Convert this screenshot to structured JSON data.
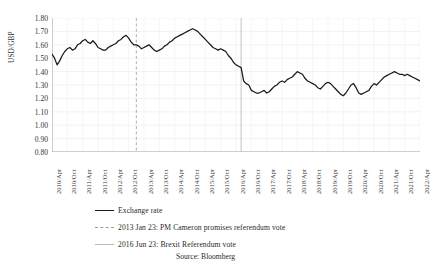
{
  "page": {
    "title_fragment": "",
    "source_note": "Source: Bloomberg"
  },
  "axes": {
    "ylabel": "USD/GBP",
    "yticks": [
      "1.80",
      "1.70",
      "1.60",
      "1.50",
      "1.40",
      "1.30",
      "1.20",
      "1.10",
      "1.00",
      "0.90",
      "0.80"
    ],
    "xticks": [
      "2010/Apr",
      "2010/Oct",
      "2011/Apr",
      "2011/Oct",
      "2012/Apr",
      "2012/Oct",
      "2013/Apr",
      "2013/Oct",
      "2014/Apr",
      "2014/Oct",
      "2015/Apr",
      "2015/Oct",
      "2016/Apr",
      "2016/Oct",
      "2017/Apr",
      "2017/Oct",
      "2018/Apr",
      "2018/Oct",
      "2019/Apr",
      "2019/Oct",
      "2020/Apr",
      "2020/Oct",
      "2021/Apr",
      "2021/Oct",
      "2022/Apr"
    ]
  },
  "legend": {
    "items": [
      {
        "label": "Exchange rate",
        "style": "solid-black"
      },
      {
        "label": "2013 Jan 23: PM Cameron promises referendum vote",
        "style": "dashed-grey"
      },
      {
        "label": "2016 Jun 23: Brexit Referendum vote",
        "style": "solid-grey"
      }
    ]
  },
  "chart_data": {
    "type": "line",
    "title": "",
    "xlabel": "",
    "ylabel": "USD/GBP",
    "ylim": [
      0.8,
      1.8
    ],
    "ytick_step": 0.1,
    "grid": true,
    "legend_position": "below",
    "x_start": "2010-04",
    "x_end": "2022-04",
    "x_tick_interval_months": 6,
    "annotations": [
      {
        "label": "2013 Jan 23: PM Cameron promises referendum vote",
        "x": "2013-01",
        "style": "dashed-grey vertical line"
      },
      {
        "label": "2016 Jun 23: Brexit Referendum vote",
        "x": "2016-06",
        "style": "solid-grey vertical line"
      }
    ],
    "series": [
      {
        "name": "Exchange rate",
        "color": "#1a1a1a",
        "x": [
          "2010-04",
          "2010-05",
          "2010-06",
          "2010-07",
          "2010-08",
          "2010-09",
          "2010-10",
          "2010-11",
          "2010-12",
          "2011-01",
          "2011-02",
          "2011-03",
          "2011-04",
          "2011-05",
          "2011-06",
          "2011-07",
          "2011-08",
          "2011-09",
          "2011-10",
          "2011-11",
          "2011-12",
          "2012-01",
          "2012-02",
          "2012-03",
          "2012-04",
          "2012-05",
          "2012-06",
          "2012-07",
          "2012-08",
          "2012-09",
          "2012-10",
          "2012-11",
          "2012-12",
          "2013-01",
          "2013-02",
          "2013-03",
          "2013-04",
          "2013-05",
          "2013-06",
          "2013-07",
          "2013-08",
          "2013-09",
          "2013-10",
          "2013-11",
          "2013-12",
          "2014-01",
          "2014-02",
          "2014-03",
          "2014-04",
          "2014-05",
          "2014-06",
          "2014-07",
          "2014-08",
          "2014-09",
          "2014-10",
          "2014-11",
          "2014-12",
          "2015-01",
          "2015-02",
          "2015-03",
          "2015-04",
          "2015-05",
          "2015-06",
          "2015-07",
          "2015-08",
          "2015-09",
          "2015-10",
          "2015-11",
          "2015-12",
          "2016-01",
          "2016-02",
          "2016-03",
          "2016-04",
          "2016-05",
          "2016-06",
          "2016-07",
          "2016-08",
          "2016-09",
          "2016-10",
          "2016-11",
          "2016-12",
          "2017-01",
          "2017-02",
          "2017-03",
          "2017-04",
          "2017-05",
          "2017-06",
          "2017-07",
          "2017-08",
          "2017-09",
          "2017-10",
          "2017-11",
          "2017-12",
          "2018-01",
          "2018-02",
          "2018-03",
          "2018-04",
          "2018-05",
          "2018-06",
          "2018-07",
          "2018-08",
          "2018-09",
          "2018-10",
          "2018-11",
          "2018-12",
          "2019-01",
          "2019-02",
          "2019-03",
          "2019-04",
          "2019-05",
          "2019-06",
          "2019-07",
          "2019-08",
          "2019-09",
          "2019-10",
          "2019-11",
          "2019-12",
          "2020-01",
          "2020-02",
          "2020-03",
          "2020-04",
          "2020-05",
          "2020-06",
          "2020-07",
          "2020-08",
          "2020-09",
          "2020-10",
          "2020-11",
          "2020-12",
          "2021-01",
          "2021-02",
          "2021-03",
          "2021-04",
          "2021-05",
          "2021-06",
          "2021-07",
          "2021-08",
          "2021-09",
          "2021-10",
          "2021-11",
          "2021-12",
          "2022-01",
          "2022-02",
          "2022-03",
          "2022-04"
        ],
        "values": [
          1.53,
          1.5,
          1.45,
          1.48,
          1.52,
          1.55,
          1.57,
          1.58,
          1.56,
          1.57,
          1.6,
          1.61,
          1.63,
          1.64,
          1.62,
          1.61,
          1.63,
          1.61,
          1.58,
          1.57,
          1.56,
          1.56,
          1.58,
          1.59,
          1.6,
          1.61,
          1.63,
          1.64,
          1.66,
          1.67,
          1.65,
          1.62,
          1.6,
          1.6,
          1.59,
          1.57,
          1.58,
          1.59,
          1.6,
          1.58,
          1.56,
          1.55,
          1.56,
          1.57,
          1.59,
          1.6,
          1.62,
          1.63,
          1.65,
          1.66,
          1.67,
          1.68,
          1.69,
          1.7,
          1.71,
          1.72,
          1.71,
          1.7,
          1.68,
          1.66,
          1.64,
          1.62,
          1.6,
          1.58,
          1.57,
          1.56,
          1.57,
          1.56,
          1.55,
          1.52,
          1.5,
          1.47,
          1.45,
          1.44,
          1.43,
          1.33,
          1.31,
          1.3,
          1.26,
          1.25,
          1.24,
          1.24,
          1.25,
          1.26,
          1.24,
          1.25,
          1.27,
          1.29,
          1.3,
          1.32,
          1.33,
          1.32,
          1.34,
          1.35,
          1.36,
          1.38,
          1.4,
          1.39,
          1.38,
          1.35,
          1.33,
          1.32,
          1.31,
          1.3,
          1.28,
          1.27,
          1.29,
          1.31,
          1.32,
          1.31,
          1.29,
          1.27,
          1.25,
          1.23,
          1.22,
          1.24,
          1.27,
          1.3,
          1.31,
          1.28,
          1.24,
          1.23,
          1.24,
          1.25,
          1.26,
          1.29,
          1.31,
          1.3,
          1.32,
          1.34,
          1.36,
          1.37,
          1.38,
          1.39,
          1.4,
          1.39,
          1.38,
          1.38,
          1.37,
          1.38,
          1.37,
          1.36,
          1.35,
          1.34,
          1.33
        ]
      }
    ]
  }
}
